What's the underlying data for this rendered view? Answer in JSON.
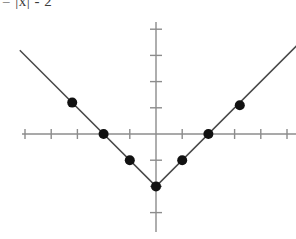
{
  "equation": {
    "text": "= |x| - 2"
  },
  "chart_data": {
    "type": "line",
    "title": "= |x| - 2",
    "xlabel": "",
    "ylabel": "",
    "function": "y = |x| - 2",
    "xlim": [
      -5.2,
      5.4
    ],
    "ylim": [
      -3.5,
      4.4
    ],
    "grid": false,
    "legend": null,
    "axis_tick_spacing": 1,
    "x_axis_ticks": [
      -5,
      -4,
      -3,
      -2,
      -1,
      1,
      2,
      3,
      4,
      5
    ],
    "y_axis_ticks": [
      -3,
      -2,
      -1,
      1,
      2,
      3,
      4
    ],
    "series": [
      {
        "name": "y = |x| - 2",
        "x": [
          -5.2,
          0,
          5.4
        ],
        "y": [
          3.2,
          -2,
          3.4
        ]
      }
    ],
    "marked_points": [
      {
        "x": -3.2,
        "y": 1.2
      },
      {
        "x": -2,
        "y": 0
      },
      {
        "x": -1,
        "y": -1
      },
      {
        "x": 0,
        "y": -2
      },
      {
        "x": 1,
        "y": -1
      },
      {
        "x": 2,
        "y": 0
      },
      {
        "x": 3.2,
        "y": 1.1
      }
    ],
    "colors": {
      "axis": "#8c8c8c",
      "curve": "#4a4a4a",
      "point": "#111111",
      "background": "#ffffff"
    }
  }
}
